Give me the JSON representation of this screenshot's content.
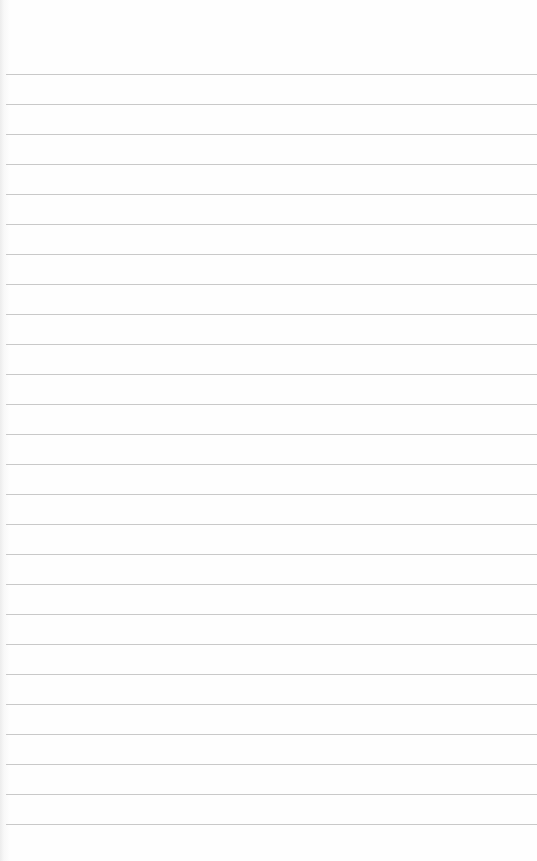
{
  "paper": {
    "type": "lined-paper",
    "background_color": "#fdfdfd",
    "line_color": "#c9c9c9",
    "first_line_y": 74,
    "line_spacing": 30,
    "line_count": 26
  }
}
